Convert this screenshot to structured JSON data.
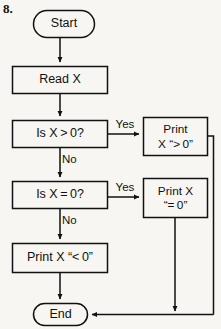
{
  "item_number": "8.",
  "diagram": {
    "type": "flowchart",
    "nodes": [
      {
        "id": "start",
        "shape": "terminator",
        "label": "Start"
      },
      {
        "id": "read",
        "shape": "process",
        "label": "Read X"
      },
      {
        "id": "dec_gt",
        "shape": "decision",
        "label": "Is X > 0?"
      },
      {
        "id": "print_gt",
        "shape": "process",
        "line1": "Print",
        "line2": "X “> 0”"
      },
      {
        "id": "dec_eq",
        "shape": "decision",
        "label": "Is X = 0?"
      },
      {
        "id": "print_eq",
        "shape": "process",
        "line1": "Print X",
        "line2": "“= 0”"
      },
      {
        "id": "print_lt",
        "shape": "process",
        "label": "Print X “< 0”"
      },
      {
        "id": "end",
        "shape": "terminator",
        "label": "End"
      }
    ],
    "edge_labels": {
      "gt_yes": "Yes",
      "gt_no": "No",
      "eq_yes": "Yes",
      "eq_no": "No"
    },
    "colors": {
      "stroke": "#111111",
      "paper": "#f7f6f2",
      "text": "#111111"
    }
  }
}
